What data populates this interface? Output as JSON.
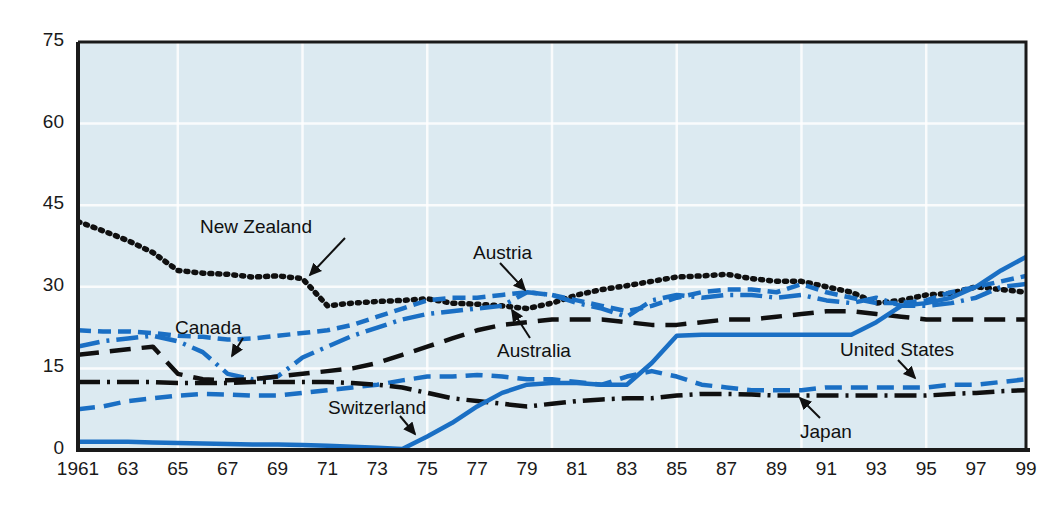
{
  "chart_data": {
    "type": "line",
    "title": "",
    "subtitle": "",
    "xlabel": "",
    "ylabel": "",
    "xlim": [
      1961,
      1999
    ],
    "ylim": [
      0,
      75
    ],
    "yticks": [
      0,
      15,
      30,
      45,
      60,
      75
    ],
    "ytick_labels": [
      "0",
      "15",
      "30",
      "45",
      "60",
      "75"
    ],
    "xticks": [
      1961,
      1963,
      1965,
      1967,
      1969,
      1971,
      1973,
      1975,
      1977,
      1979,
      1981,
      1983,
      1985,
      1987,
      1989,
      1991,
      1993,
      1995,
      1997,
      1999
    ],
    "xtick_labels": [
      "1961",
      "63",
      "65",
      "67",
      "69",
      "71",
      "73",
      "75",
      "77",
      "79",
      "81",
      "83",
      "85",
      "87",
      "89",
      "91",
      "93",
      "95",
      "97",
      "99"
    ],
    "grid": true,
    "grid_color": "#ffffff",
    "plot_bgcolor": "#dceaf1",
    "legend_position": "inline-annotations",
    "x": [
      1961,
      1962,
      1963,
      1964,
      1965,
      1966,
      1967,
      1968,
      1969,
      1970,
      1971,
      1972,
      1973,
      1974,
      1975,
      1976,
      1977,
      1978,
      1979,
      1980,
      1981,
      1982,
      1983,
      1984,
      1985,
      1986,
      1987,
      1988,
      1989,
      1990,
      1991,
      1992,
      1993,
      1994,
      1995,
      1996,
      1997,
      1998,
      1999
    ],
    "series": [
      {
        "name": "New Zealand",
        "color": "#101010",
        "style": "dotted",
        "label_position": "upper-left",
        "values": [
          42.0,
          40.3,
          38.5,
          36.3,
          33.0,
          32.5,
          32.3,
          31.8,
          32.0,
          31.5,
          26.5,
          27.0,
          27.3,
          27.5,
          27.8,
          27.0,
          26.8,
          26.5,
          26.0,
          27.0,
          28.5,
          29.5,
          30.2,
          31.0,
          31.8,
          32.0,
          32.3,
          31.5,
          31.0,
          31.0,
          30.0,
          29.0,
          27.0,
          27.5,
          28.5,
          28.8,
          30.0,
          29.5,
          29.0
        ]
      },
      {
        "name": "Canada",
        "color": "#1a6fc4",
        "style": "dashed",
        "label_position": "left",
        "values": [
          22.0,
          21.8,
          21.8,
          21.5,
          21.0,
          20.8,
          20.3,
          20.5,
          21.0,
          21.5,
          22.0,
          23.0,
          24.5,
          26.0,
          27.5,
          28.0,
          28.0,
          28.5,
          29.0,
          28.5,
          27.5,
          26.5,
          25.5,
          26.5,
          28.0,
          29.0,
          29.5,
          29.5,
          29.0,
          30.5,
          29.0,
          28.0,
          27.0,
          27.0,
          27.5,
          29.0,
          30.0,
          31.0,
          32.0
        ]
      },
      {
        "name": "Austria",
        "color": "#1a6fc4",
        "style": "dashdot",
        "label_position": "center-top",
        "values": [
          19.0,
          20.0,
          20.5,
          21.0,
          20.0,
          18.0,
          14.0,
          13.0,
          13.5,
          17.0,
          19.0,
          21.0,
          22.5,
          24.0,
          25.0,
          25.5,
          26.0,
          26.5,
          29.0,
          28.5,
          27.0,
          26.0,
          24.5,
          27.5,
          28.5,
          28.0,
          28.5,
          28.5,
          28.0,
          28.5,
          27.5,
          27.0,
          28.0,
          26.5,
          26.5,
          27.0,
          28.0,
          30.0,
          30.5
        ]
      },
      {
        "name": "Australia",
        "color": "#101010",
        "style": "dashed-long",
        "label_position": "center",
        "values": [
          17.5,
          18.0,
          18.5,
          19.0,
          14.0,
          13.0,
          12.8,
          13.0,
          13.5,
          14.0,
          14.5,
          15.0,
          16.0,
          17.5,
          19.0,
          20.5,
          22.0,
          23.0,
          23.5,
          24.0,
          24.0,
          24.0,
          23.5,
          23.0,
          23.0,
          23.5,
          24.0,
          24.0,
          24.5,
          25.0,
          25.5,
          25.5,
          25.0,
          24.5,
          24.0,
          24.0,
          24.0,
          24.0,
          24.0
        ]
      },
      {
        "name": "United States",
        "color": "#1a6fc4",
        "style": "dashed-med",
        "label_position": "right",
        "values": [
          7.5,
          8.0,
          9.0,
          9.5,
          10.0,
          10.3,
          10.2,
          10.0,
          10.0,
          10.5,
          11.0,
          11.5,
          12.0,
          12.8,
          13.5,
          13.5,
          13.8,
          13.5,
          13.0,
          13.0,
          12.5,
          12.0,
          13.5,
          14.5,
          13.5,
          12.0,
          11.5,
          11.0,
          11.0,
          11.0,
          11.5,
          11.5,
          11.5,
          11.5,
          11.5,
          12.0,
          12.0,
          12.5,
          13.0
        ]
      },
      {
        "name": "Japan",
        "color": "#101010",
        "style": "dashdot",
        "label_position": "right-bottom",
        "values": [
          12.5,
          12.5,
          12.5,
          12.5,
          12.3,
          12.3,
          12.3,
          12.5,
          12.5,
          12.5,
          12.5,
          12.3,
          12.0,
          11.5,
          10.5,
          9.5,
          9.0,
          8.5,
          8.0,
          8.5,
          9.0,
          9.3,
          9.5,
          9.5,
          10.0,
          10.3,
          10.3,
          10.2,
          10.0,
          10.0,
          10.0,
          10.0,
          10.0,
          10.0,
          10.0,
          10.3,
          10.5,
          10.8,
          11.0
        ]
      },
      {
        "name": "Switzerland",
        "color": "#1a6fc4",
        "style": "solid",
        "label_position": "lower-center",
        "values": [
          1.5,
          1.5,
          1.5,
          1.4,
          1.3,
          1.2,
          1.1,
          1.0,
          1.0,
          0.9,
          0.8,
          0.6,
          0.4,
          0.2,
          2.5,
          5.0,
          8.0,
          10.5,
          12.0,
          12.3,
          12.3,
          12.0,
          12.0,
          16.0,
          21.0,
          21.2,
          21.2,
          21.2,
          21.2,
          21.2,
          21.2,
          21.2,
          23.5,
          26.5,
          27.0,
          28.0,
          30.0,
          33.0,
          35.5
        ]
      }
    ],
    "annotations": [
      {
        "id": "new-zealand",
        "text": "New Zealand"
      },
      {
        "id": "canada",
        "text": "Canada"
      },
      {
        "id": "austria",
        "text": "Austria"
      },
      {
        "id": "australia",
        "text": "Australia"
      },
      {
        "id": "switzerland",
        "text": "Switzerland"
      },
      {
        "id": "united-states",
        "text": "United States"
      },
      {
        "id": "japan",
        "text": "Japan"
      }
    ]
  }
}
